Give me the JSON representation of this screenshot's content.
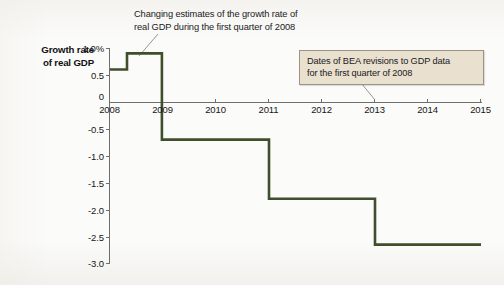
{
  "figure": {
    "y_axis_title_line1": "Growth rate",
    "y_axis_title_line2": "of real GDP",
    "top_annotation_line1": "Changing estimates of the growth rate of",
    "top_annotation_line2": "real GDP during the first quarter of 2008",
    "callout_line1": "Dates of BEA revisions to GDP data",
    "callout_line2": "for the first quarter of 2008",
    "line_color": "#3f4f2b",
    "callout_fill": "#e9e0cf",
    "callout_border": "#9c9482",
    "axis_color": "#6e6e6e"
  },
  "chart_data": {
    "type": "line",
    "subtype": "step",
    "title": "",
    "xlabel": "",
    "ylabel": "Growth rate of real GDP",
    "xlim": [
      2008,
      2015
    ],
    "ylim": [
      -3.0,
      1.0
    ],
    "grid": false,
    "legend": false,
    "y_ticks": [
      1.0,
      0.5,
      0,
      -0.5,
      -1.0,
      -1.5,
      -2.0,
      -2.5,
      -3.0
    ],
    "y_tick_labels": [
      "1.0%",
      "0.5",
      "0",
      "-0.5",
      "-1.0",
      "-1.5",
      "-2.0",
      "-2.5",
      "-3.0"
    ],
    "x_ticks": [
      2008,
      2009,
      2010,
      2011,
      2012,
      2013,
      2014,
      2015
    ],
    "x_tick_labels": [
      "2008",
      "2009",
      "2010",
      "2011",
      "2012",
      "2013",
      "2014",
      "2015"
    ],
    "series": [
      {
        "name": "Revised estimate of 2008 Q1 real GDP growth",
        "steps": [
          {
            "x_start": 2008.0,
            "x_end": 2008.32,
            "value": 0.6
          },
          {
            "x_start": 2008.32,
            "x_end": 2008.98,
            "value": 0.9
          },
          {
            "x_start": 2008.98,
            "x_end": 2011.0,
            "value": -0.7
          },
          {
            "x_start": 2011.0,
            "x_end": 2013.0,
            "value": -1.8
          },
          {
            "x_start": 2013.0,
            "x_end": 2015.0,
            "value": -2.65
          }
        ],
        "revision_dates": [
          2008.32,
          2008.98,
          2011.0,
          2013.0
        ]
      }
    ]
  }
}
